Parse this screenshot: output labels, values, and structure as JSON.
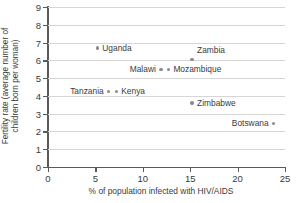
{
  "chart_data": {
    "type": "scatter",
    "title": "",
    "xlabel": "% of population infected with HIV/AIDS",
    "ylabel": "Fertility rate (average number of\nchildren born per woman)",
    "xlim": [
      0,
      25
    ],
    "ylim": [
      0,
      9
    ],
    "xticks": [
      "0",
      "5",
      "10",
      "15",
      "20",
      "25"
    ],
    "yticks": [
      "0",
      "1",
      "2",
      "3",
      "4",
      "5",
      "6",
      "7",
      "8",
      "9"
    ],
    "grid": "horizontal",
    "legend": "none",
    "marker_color": "#8c8c8c",
    "axis_color": "#5a5a5a",
    "grid_color": "#d6d6d6",
    "points": [
      {
        "label": "Uganda",
        "x": 5.2,
        "y": 6.7,
        "label_pos": "right"
      },
      {
        "label": "Zambia",
        "x": 15.2,
        "y": 6.05,
        "label_pos": "above-right"
      },
      {
        "label": "Malawi",
        "x": 11.9,
        "y": 5.5,
        "label_pos": "left"
      },
      {
        "label": "Mozambique",
        "x": 12.7,
        "y": 5.5,
        "label_pos": "right"
      },
      {
        "label": "Tanzania",
        "x": 6.4,
        "y": 4.25,
        "label_pos": "left"
      },
      {
        "label": "Kenya",
        "x": 7.2,
        "y": 4.25,
        "label_pos": "right"
      },
      {
        "label": "Zimbabwe",
        "x": 15.2,
        "y": 3.6,
        "label_pos": "right"
      },
      {
        "label": "Botswana",
        "x": 23.8,
        "y": 2.45,
        "label_pos": "left"
      }
    ]
  }
}
